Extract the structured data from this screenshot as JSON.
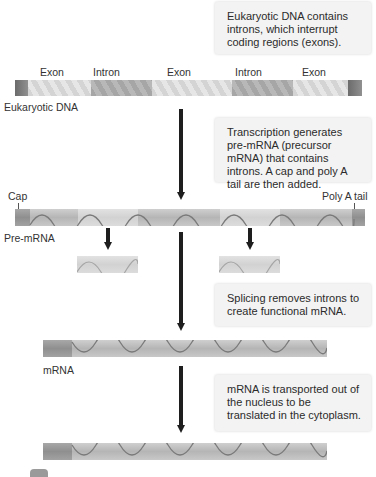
{
  "notes": {
    "dna": "Eukaryotic DNA contains introns, which interrupt coding regions (exons).",
    "transcription": "Transcription generates pre-mRNA (precursor mRNA) that contains introns. A cap and poly A tail are then added.",
    "splicing": "Splicing removes introns to create functional mRNA.",
    "transport": "mRNA is transported out of the nucleus to be translated in the cytoplasm."
  },
  "dna": {
    "label": "Eukaryotic DNA",
    "segments": [
      "Exon",
      "Intron",
      "Exon",
      "Intron",
      "Exon"
    ]
  },
  "pre_mrna": {
    "label": "Pre-mRNA",
    "cap_label": "Cap",
    "tail_label": "Poly A tail"
  },
  "mrna": {
    "label": "mRNA"
  },
  "colors": {
    "arrow": "#1e1e1e",
    "note_bg": "#f3f3f3",
    "exon": "#d4d4d4",
    "intron": "#a6a6a6"
  }
}
